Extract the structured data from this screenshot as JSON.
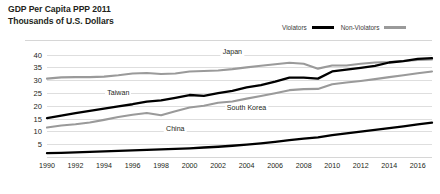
{
  "title": {
    "line1": "GDP Per Capita PPP 2011",
    "line2": "Thousands of U.S. Dollars"
  },
  "legend": {
    "items": [
      {
        "label": "Violators",
        "color": "#000000",
        "swatch": "violators-swatch"
      },
      {
        "label": "Non-Violators",
        "color": "#9a9a9a",
        "swatch": "nonviolators-swatch"
      }
    ]
  },
  "colors": {
    "violator": "#000000",
    "nonviolator": "#9a9a9a",
    "grid": "#dedede",
    "text": "#231f20"
  },
  "chart_data": {
    "type": "line",
    "title": "GDP Per Capita PPP 2011",
    "subtitle": "Thousands of U.S. Dollars",
    "xlabel": "",
    "ylabel": "Thousands of U.S. Dollars",
    "xlim": [
      1990,
      2017
    ],
    "ylim": [
      0,
      41
    ],
    "yticks": [
      5,
      10,
      15,
      20,
      25,
      30,
      35,
      40
    ],
    "xticks": [
      1990,
      1992,
      1994,
      1996,
      1998,
      2000,
      2002,
      2004,
      2006,
      2008,
      2010,
      2012,
      2014,
      2016
    ],
    "grid": true,
    "legend_position": "top-right",
    "x": [
      1990,
      1991,
      1992,
      1993,
      1994,
      1995,
      1996,
      1997,
      1998,
      1999,
      2000,
      2001,
      2002,
      2003,
      2004,
      2005,
      2006,
      2007,
      2008,
      2009,
      2010,
      2011,
      2012,
      2013,
      2014,
      2015,
      2016,
      2017
    ],
    "series": [
      {
        "name": "Japan",
        "group": "Non-Violators",
        "color": "#9a9a9a",
        "values": [
          30.6,
          31.1,
          31.2,
          31.2,
          31.4,
          31.9,
          32.6,
          32.8,
          32.4,
          32.6,
          33.4,
          33.6,
          33.8,
          34.3,
          35.0,
          35.6,
          36.2,
          36.8,
          36.4,
          34.5,
          35.7,
          35.7,
          36.4,
          36.9,
          37.1,
          37.5,
          37.9,
          38.1
        ],
        "label_at": {
          "x": 2003,
          "y": 41.0
        }
      },
      {
        "name": "Taiwan",
        "group": "Violators",
        "color": "#000000",
        "values": [
          15.2,
          16.2,
          17.1,
          18.0,
          18.9,
          19.8,
          20.6,
          21.6,
          22.1,
          23.1,
          24.2,
          23.9,
          24.9,
          25.8,
          27.2,
          28.1,
          29.4,
          31.0,
          31.0,
          30.6,
          33.4,
          34.1,
          34.8,
          35.6,
          36.9,
          37.4,
          38.3,
          38.6
        ],
        "label_at": {
          "x": 1995,
          "y": 25.0
        }
      },
      {
        "name": "South Korea",
        "group": "Non-Violators",
        "color": "#9a9a9a",
        "values": [
          11.5,
          12.3,
          12.8,
          13.5,
          14.5,
          15.6,
          16.5,
          17.2,
          16.3,
          17.9,
          19.3,
          20.0,
          21.2,
          21.7,
          22.8,
          23.8,
          24.9,
          26.1,
          26.5,
          26.6,
          28.4,
          29.1,
          29.7,
          30.4,
          31.2,
          31.9,
          32.7,
          33.4
        ],
        "label_at": {
          "x": 2004,
          "y": 19.0
        }
      },
      {
        "name": "China",
        "group": "Violators",
        "color": "#000000",
        "values": [
          1.5,
          1.6,
          1.8,
          2.0,
          2.2,
          2.4,
          2.6,
          2.8,
          3.0,
          3.2,
          3.4,
          3.7,
          4.0,
          4.4,
          4.8,
          5.3,
          5.9,
          6.6,
          7.2,
          7.7,
          8.5,
          9.2,
          9.9,
          10.6,
          11.3,
          12.0,
          12.7,
          13.4
        ],
        "label_at": {
          "x": 1999,
          "y": 11.0
        }
      }
    ]
  }
}
